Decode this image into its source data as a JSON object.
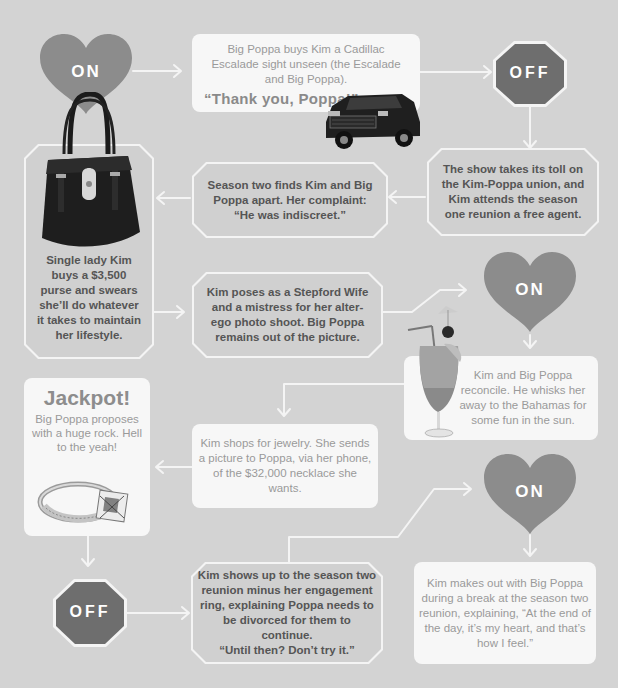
{
  "diagram": {
    "colors": {
      "background": "#d3d3d3",
      "heart_fill": "#8c8c8c",
      "stop_fill": "#6e6e6e",
      "on_box": "#f7f7f7",
      "off_box": "#d0d0d0",
      "connector": "#f4f4f4"
    },
    "nodes": [
      {
        "id": "on1",
        "type": "heart",
        "label": "ON"
      },
      {
        "id": "escalade",
        "type": "on-event",
        "text": "Big Poppa buys Kim a Cadillac Escalade sight unseen (the Escalade and Big Poppa).",
        "quote": "“Thank you, Poppa!”",
        "image": "cadillac-escalade"
      },
      {
        "id": "off1",
        "type": "stop",
        "label": "OFF"
      },
      {
        "id": "toll",
        "type": "off-event",
        "text": "The show takes its toll on the Kim-Poppa union, and Kim attends the season one reunion a free agent."
      },
      {
        "id": "apart",
        "type": "off-event",
        "text": "Season two finds Kim and Big Poppa apart. Her complaint: “He was indiscreet.”"
      },
      {
        "id": "purse",
        "type": "off-event",
        "text": "Single lady Kim buys a $3,500 purse and swears she’ll do whatever it takes to maintain her lifestyle.",
        "image": "handbag"
      },
      {
        "id": "stepford",
        "type": "off-event",
        "text": "Kim poses as a Stepford Wife and a mistress for her alter-ego photo shoot. Big Poppa remains out of the picture."
      },
      {
        "id": "on2",
        "type": "heart",
        "label": "ON"
      },
      {
        "id": "bahamas",
        "type": "on-event",
        "text": "Kim and Big Poppa reconcile. He whisks her away to the Bahamas for some fun in the sun.",
        "image": "tropical-cocktail"
      },
      {
        "id": "jewelry",
        "type": "on-event",
        "text": "Kim shops for jewelry. She sends a picture to Poppa, via her phone, of the $32,000 necklace she wants."
      },
      {
        "id": "jackpot",
        "type": "on-event",
        "heading": "Jackpot!",
        "text": "Big Poppa proposes with a huge rock. Hell to the yeah!",
        "image": "engagement-ring"
      },
      {
        "id": "off2",
        "type": "stop",
        "label": "OFF"
      },
      {
        "id": "reunion",
        "type": "off-event",
        "text": "Kim shows up to the season two reunion minus her engagement ring, explaining Poppa needs to be divorced for them to continue.",
        "quote": "“Until then? Don’t try it.”"
      },
      {
        "id": "on3",
        "type": "heart",
        "label": "ON"
      },
      {
        "id": "makeout",
        "type": "on-event",
        "text": "Kim makes out with Big Poppa during a break at the season two reunion, explaining, “At the end of the day, it’s my heart, and that’s how I feel.”"
      }
    ],
    "edges": [
      [
        "on1",
        "escalade"
      ],
      [
        "escalade",
        "off1"
      ],
      [
        "off1",
        "toll"
      ],
      [
        "toll",
        "apart"
      ],
      [
        "apart",
        "purse"
      ],
      [
        "purse",
        "stepford"
      ],
      [
        "stepford",
        "on2"
      ],
      [
        "on2",
        "bahamas"
      ],
      [
        "bahamas",
        "jewelry"
      ],
      [
        "jewelry",
        "jackpot"
      ],
      [
        "jackpot",
        "off2"
      ],
      [
        "off2",
        "reunion"
      ],
      [
        "reunion",
        "on3"
      ],
      [
        "on3",
        "makeout"
      ]
    ]
  }
}
